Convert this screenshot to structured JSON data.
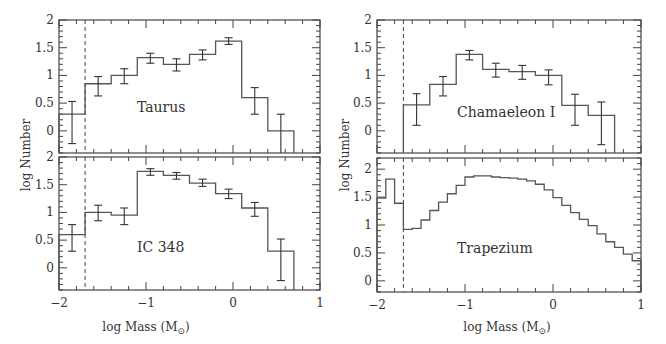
{
  "chart_data": {
    "type": "bar",
    "subtype": "step-histogram-with-errorbars",
    "layout": "two columns of two stacked panels, shared x axis per column",
    "xlabel": "log Mass (M⊙)",
    "ylabel": "log Number",
    "x_ticks": [
      "−2",
      "−1",
      "0",
      "1"
    ],
    "y_ticks": [
      "0",
      "0.5",
      "1",
      "1.5",
      "2"
    ],
    "completeness_limit_dashed_x": -1.7,
    "panels": [
      {
        "name": "Taurus",
        "position": "top-left",
        "xlim": [
          -2,
          1
        ],
        "ylim": [
          -0.4,
          2.0
        ],
        "bin_width": 0.3,
        "bins": [
          {
            "x0": -2.0,
            "x1": -1.7,
            "y": 0.3,
            "err_hi": 0.53,
            "err_lo": -0.23
          },
          {
            "x0": -1.7,
            "x1": -1.4,
            "y": 0.85,
            "err_hi": 0.98,
            "err_lo": 0.63
          },
          {
            "x0": -1.4,
            "x1": -1.1,
            "y": 1.0,
            "err_hi": 1.12,
            "err_lo": 0.85
          },
          {
            "x0": -1.1,
            "x1": -0.8,
            "y": 1.32,
            "err_hi": 1.4,
            "err_lo": 1.22
          },
          {
            "x0": -0.8,
            "x1": -0.5,
            "y": 1.2,
            "err_hi": 1.3,
            "err_lo": 1.08
          },
          {
            "x0": -0.5,
            "x1": -0.2,
            "y": 1.38,
            "err_hi": 1.46,
            "err_lo": 1.28
          },
          {
            "x0": -0.2,
            "x1": 0.1,
            "y": 1.62,
            "err_hi": 1.68,
            "err_lo": 1.56
          },
          {
            "x0": 0.1,
            "x1": 0.4,
            "y": 0.6,
            "err_hi": 0.78,
            "err_lo": 0.3
          },
          {
            "x0": 0.4,
            "x1": 0.7,
            "y": 0.0,
            "err_hi": 0.3,
            "err_lo": -0.4
          }
        ]
      },
      {
        "name": "IC 348",
        "position": "bottom-left",
        "xlim": [
          -2,
          1
        ],
        "ylim": [
          -0.4,
          2.0
        ],
        "bin_width": 0.3,
        "bins": [
          {
            "x0": -2.0,
            "x1": -1.7,
            "y": 0.6,
            "err_hi": 0.78,
            "err_lo": 0.3
          },
          {
            "x0": -1.7,
            "x1": -1.4,
            "y": 1.0,
            "err_hi": 1.13,
            "err_lo": 0.85
          },
          {
            "x0": -1.4,
            "x1": -1.1,
            "y": 0.95,
            "err_hi": 1.08,
            "err_lo": 0.78
          },
          {
            "x0": -1.1,
            "x1": -0.8,
            "y": 1.74,
            "err_hi": 1.79,
            "err_lo": 1.67
          },
          {
            "x0": -0.8,
            "x1": -0.5,
            "y": 1.67,
            "err_hi": 1.72,
            "err_lo": 1.6
          },
          {
            "x0": -0.5,
            "x1": -0.2,
            "y": 1.53,
            "err_hi": 1.6,
            "err_lo": 1.47
          },
          {
            "x0": -0.2,
            "x1": 0.1,
            "y": 1.34,
            "err_hi": 1.42,
            "err_lo": 1.25
          },
          {
            "x0": 0.1,
            "x1": 0.4,
            "y": 1.08,
            "err_hi": 1.18,
            "err_lo": 0.93
          },
          {
            "x0": 0.4,
            "x1": 0.7,
            "y": 0.3,
            "err_hi": 0.52,
            "err_lo": -0.23
          }
        ]
      },
      {
        "name": "Chamaeleon I",
        "position": "top-right",
        "xlim": [
          -2,
          1
        ],
        "ylim": [
          -0.4,
          2.0
        ],
        "bin_width": 0.3,
        "bins": [
          {
            "x0": -1.7,
            "x1": -1.4,
            "y": 0.47,
            "err_hi": 0.67,
            "err_lo": 0.1
          },
          {
            "x0": -1.4,
            "x1": -1.1,
            "y": 0.84,
            "err_hi": 0.98,
            "err_lo": 0.63
          },
          {
            "x0": -1.1,
            "x1": -0.8,
            "y": 1.38,
            "err_hi": 1.45,
            "err_lo": 1.28
          },
          {
            "x0": -0.8,
            "x1": -0.5,
            "y": 1.11,
            "err_hi": 1.22,
            "err_lo": 0.97
          },
          {
            "x0": -0.5,
            "x1": -0.2,
            "y": 1.07,
            "err_hi": 1.18,
            "err_lo": 0.93
          },
          {
            "x0": -0.2,
            "x1": 0.1,
            "y": 1.0,
            "err_hi": 1.1,
            "err_lo": 0.83
          },
          {
            "x0": 0.1,
            "x1": 0.4,
            "y": 0.46,
            "err_hi": 0.66,
            "err_lo": 0.1
          },
          {
            "x0": 0.4,
            "x1": 0.7,
            "y": 0.28,
            "err_hi": 0.52,
            "err_lo": -0.25
          }
        ]
      },
      {
        "name": "Trapezium",
        "position": "bottom-right",
        "xlim": [
          -2,
          1
        ],
        "ylim": [
          -0.2,
          2.2
        ],
        "bin_width": 0.1,
        "bins": [
          {
            "x0": -2.0,
            "x1": -1.9,
            "y": 1.48
          },
          {
            "x0": -1.9,
            "x1": -1.8,
            "y": 1.82
          },
          {
            "x0": -1.8,
            "x1": -1.7,
            "y": 1.39
          },
          {
            "x0": -1.7,
            "x1": -1.6,
            "y": 0.92
          },
          {
            "x0": -1.6,
            "x1": -1.5,
            "y": 0.94
          },
          {
            "x0": -1.5,
            "x1": -1.4,
            "y": 1.09
          },
          {
            "x0": -1.4,
            "x1": -1.3,
            "y": 1.26
          },
          {
            "x0": -1.3,
            "x1": -1.2,
            "y": 1.41
          },
          {
            "x0": -1.2,
            "x1": -1.1,
            "y": 1.56
          },
          {
            "x0": -1.1,
            "x1": -1.0,
            "y": 1.71
          },
          {
            "x0": -1.0,
            "x1": -0.9,
            "y": 1.86
          },
          {
            "x0": -0.9,
            "x1": -0.8,
            "y": 1.88
          },
          {
            "x0": -0.8,
            "x1": -0.7,
            "y": 1.88
          },
          {
            "x0": -0.7,
            "x1": -0.6,
            "y": 1.86
          },
          {
            "x0": -0.6,
            "x1": -0.5,
            "y": 1.85
          },
          {
            "x0": -0.5,
            "x1": -0.4,
            "y": 1.84
          },
          {
            "x0": -0.4,
            "x1": -0.3,
            "y": 1.82
          },
          {
            "x0": -0.3,
            "x1": -0.2,
            "y": 1.79
          },
          {
            "x0": -0.2,
            "x1": -0.1,
            "y": 1.73
          },
          {
            "x0": -0.1,
            "x1": 0.0,
            "y": 1.63
          },
          {
            "x0": 0.0,
            "x1": 0.1,
            "y": 1.49
          },
          {
            "x0": 0.1,
            "x1": 0.2,
            "y": 1.35
          },
          {
            "x0": 0.2,
            "x1": 0.3,
            "y": 1.22
          },
          {
            "x0": 0.3,
            "x1": 0.4,
            "y": 1.1
          },
          {
            "x0": 0.4,
            "x1": 0.5,
            "y": 0.99
          },
          {
            "x0": 0.5,
            "x1": 0.6,
            "y": 0.84
          },
          {
            "x0": 0.6,
            "x1": 0.7,
            "y": 0.7
          },
          {
            "x0": 0.7,
            "x1": 0.8,
            "y": 0.6
          },
          {
            "x0": 0.8,
            "x1": 0.9,
            "y": 0.48
          },
          {
            "x0": 0.9,
            "x1": 1.0,
            "y": 0.36
          }
        ]
      }
    ]
  },
  "labels": {
    "xlabel_left": "log Mass (M",
    "xlabel_right": "log Mass (M",
    "xlabel_sub": "⊙",
    "xlabel_close": ")",
    "ylabel_left": "log Number",
    "ylabel_right": "log Number"
  }
}
